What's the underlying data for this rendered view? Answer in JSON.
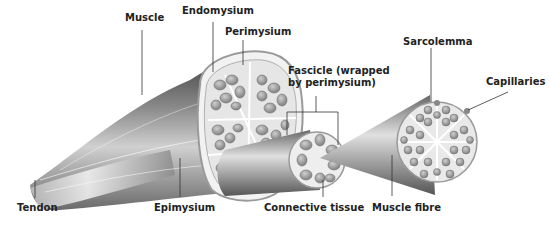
{
  "diagram": {
    "labels": {
      "muscle": "Muscle",
      "endomysium": "Endomysium",
      "perimysium": "Perimysium",
      "fascicle": "Fascicle (wrapped\nby perimysium)",
      "sarcolemma": "Sarcolemma",
      "capillaries": "Capillaries",
      "tendon": "Tendon",
      "epimysium": "Epimysium",
      "connective_tissue": "Connective tissue",
      "muscle_fibre": "Muscle fibre"
    },
    "colors": {
      "muscle_dark": "#555555",
      "muscle_mid": "#8a8a8a",
      "muscle_light": "#e8e8e8",
      "cell": "#8c8c8c",
      "cell_fill": "#bdbdbd",
      "leader_line": "#333333"
    }
  }
}
